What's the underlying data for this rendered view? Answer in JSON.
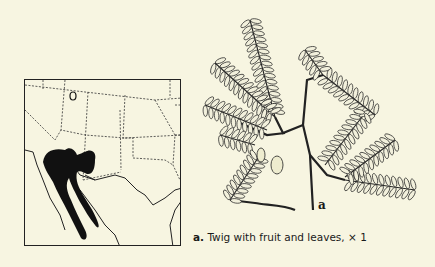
{
  "map": {
    "label": "range-map",
    "range_color": "#111111"
  },
  "figure": {
    "part_letter": "a",
    "caption_letter": "a.",
    "caption_text": "Twig with fruit and leaves,",
    "caption_scale": "× 1"
  }
}
